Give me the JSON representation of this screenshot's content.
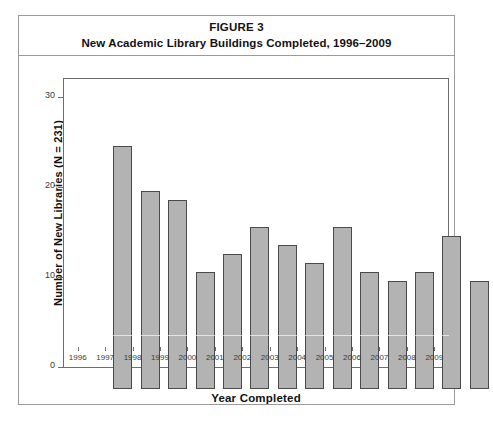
{
  "figure": {
    "label": "FIGURE 3",
    "title": "New Academic Library Buildings Completed, 1996–2009"
  },
  "chart_data": {
    "type": "bar",
    "title": "New Academic Library Buildings Completed, 1996–2009",
    "xlabel": "Year Completed",
    "ylabel": "Number of New Libraries (N = 231)",
    "categories": [
      "1996",
      "1997",
      "1998",
      "1999",
      "2000",
      "2001",
      "2002",
      "2003",
      "2004",
      "2005",
      "2006",
      "2007",
      "2008",
      "2009"
    ],
    "values": [
      27,
      22,
      21,
      13,
      15,
      18,
      16,
      14,
      18,
      13,
      12,
      13,
      17,
      12
    ],
    "ylim": [
      0,
      32
    ],
    "yticks": [
      0,
      10,
      20,
      30
    ],
    "ytick_labels": [
      "0",
      "10",
      "20",
      "30"
    ],
    "grid": false,
    "legend": false,
    "bar_color": "#b3b3b3",
    "bar_edge_color": "#4a4a4a",
    "frame_color": "#6d6d6d",
    "total_n": 231
  }
}
